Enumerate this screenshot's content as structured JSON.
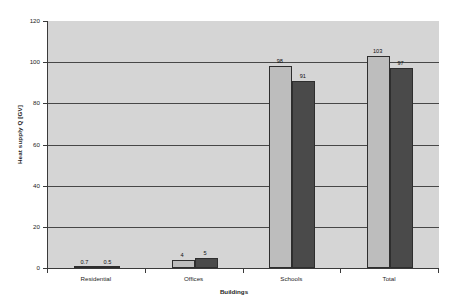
{
  "chart_data": {
    "type": "bar",
    "title": "",
    "xlabel": "Buildings",
    "ylabel": "Heat supply Q [GV]",
    "categories": [
      "Residential",
      "Offices",
      "Schools",
      "Total"
    ],
    "series": [
      {
        "name": "series-1",
        "color": "#bdbdbd",
        "values": [
          0.7,
          4,
          98,
          103
        ],
        "labels": [
          "0.7",
          "4",
          "98",
          "103"
        ]
      },
      {
        "name": "series-2",
        "color": "#4a4a4a",
        "values": [
          0.5,
          5,
          91,
          97
        ],
        "labels": [
          "0.5",
          "5",
          "91",
          "97"
        ]
      }
    ],
    "ylim": [
      0,
      120
    ],
    "yticks": [
      0,
      20,
      40,
      60,
      80,
      100,
      120
    ],
    "ytick_labels": [
      "0",
      "20",
      "40",
      "60",
      "80",
      "100",
      "120"
    ],
    "gridlines": [
      20,
      40,
      60,
      80,
      100
    ],
    "grid": true,
    "legend": "none",
    "plot_background": "#d5d5d5",
    "figure_background": "#ffffff",
    "axis_color": "#3a3a3a"
  }
}
